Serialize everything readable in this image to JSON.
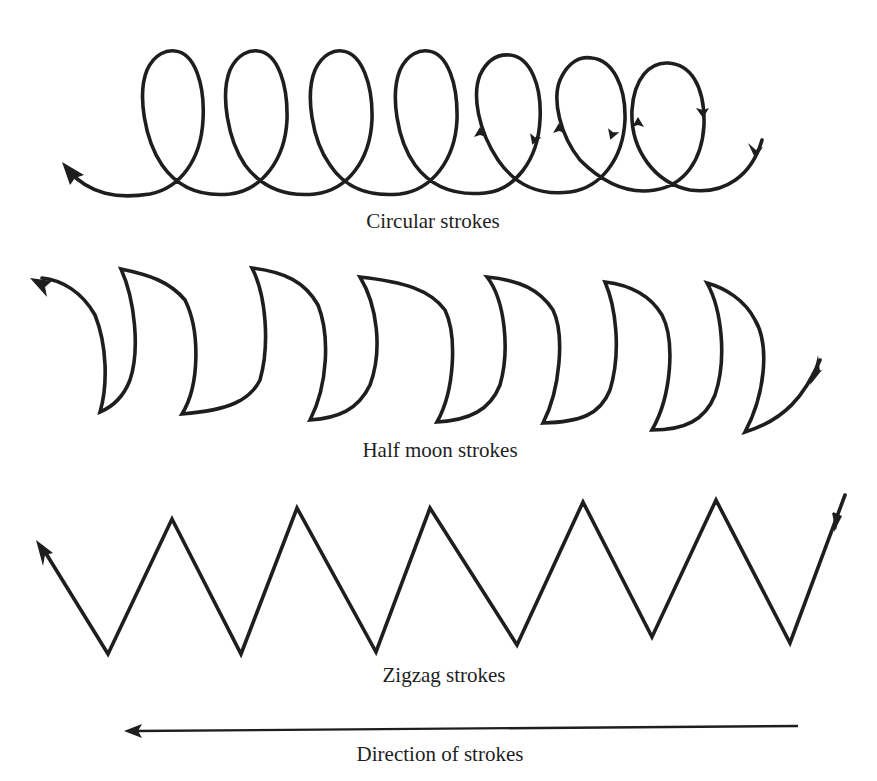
{
  "figure": {
    "rows": [
      {
        "id": "circular",
        "label": "Circular strokes",
        "loop_count": 7
      },
      {
        "id": "half-moon",
        "label": "Half moon strokes",
        "crescent_count": 7
      },
      {
        "id": "zigzag",
        "label": "Zigzag strokes",
        "peak_count": 6,
        "valley_count": 6
      }
    ],
    "direction": {
      "label": "Direction of strokes",
      "arrow": "left-arrow"
    },
    "colors": {
      "ink": "#1e1e1e",
      "background": "#ffffff"
    }
  }
}
